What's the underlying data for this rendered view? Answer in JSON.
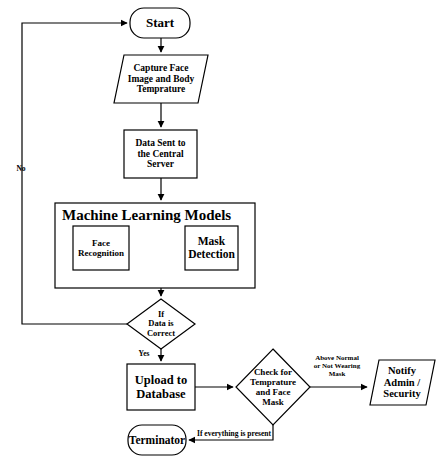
{
  "diagram": {
    "background_color": "#ffffff",
    "stroke_color": "#000000",
    "text_color": "#000000"
  },
  "nodes": {
    "start": {
      "label": "Start",
      "shape": "terminator-rounded"
    },
    "capture": {
      "label": "Capture Face\nImage and Body\nTemprature",
      "shape": "parallelogram"
    },
    "data_sent": {
      "label": "Data Sent to\nthe Central\nServer",
      "shape": "rectangle"
    },
    "ml_models": {
      "label": "Machine Learning Models",
      "shape": "rectangle"
    },
    "face_recognition": {
      "label": "Face\nRecognition",
      "shape": "rectangle"
    },
    "mask_detection": {
      "label": "Mask\nDetection",
      "shape": "rectangle"
    },
    "data_correct": {
      "label": "If\nData is\nCorrect",
      "shape": "diamond"
    },
    "upload_db": {
      "label": "Upload to\nDatabase",
      "shape": "rectangle"
    },
    "check_temp_mask": {
      "label": "Check for\nTemprature\nand Face\nMask",
      "shape": "diamond"
    },
    "notify": {
      "label": "Notify\nAdmin /\nSecurity",
      "shape": "parallelogram"
    },
    "terminator": {
      "label": "Terminator",
      "shape": "terminator-rounded"
    }
  },
  "edge_labels": {
    "no": "No",
    "yes": "Yes",
    "above_normal": "Above Normal\nor Not Wearing\nMask",
    "everything_present": "If everything is present"
  },
  "edges": [
    {
      "from": "start",
      "to": "capture",
      "label": ""
    },
    {
      "from": "capture",
      "to": "data_sent",
      "label": ""
    },
    {
      "from": "data_sent",
      "to": "ml_models",
      "label": ""
    },
    {
      "from": "ml_models",
      "to": "data_correct",
      "label": ""
    },
    {
      "from": "data_correct",
      "to": "start",
      "label": "No"
    },
    {
      "from": "data_correct",
      "to": "upload_db",
      "label": "Yes"
    },
    {
      "from": "upload_db",
      "to": "check_temp_mask",
      "label": ""
    },
    {
      "from": "check_temp_mask",
      "to": "notify",
      "label": "Above Normal or Not Wearing Mask"
    },
    {
      "from": "check_temp_mask",
      "to": "terminator",
      "label": "If everything is present"
    }
  ]
}
